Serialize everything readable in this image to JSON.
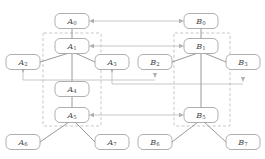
{
  "diagram": {
    "colors": {
      "node_stroke": "#9a9a9a",
      "node_fill": "#ffffff",
      "label": "#4a4a4a",
      "tree_edge": "#8f8f8f",
      "group_box": "#b9b9b9",
      "map_arrow": "#b0b0b0",
      "background": "#ffffff"
    },
    "trees": [
      {
        "name": "tree-a",
        "prefix": "A",
        "nodes": [
          {
            "id": "A0",
            "base": "A",
            "sub": "0",
            "x": 72,
            "y": 21
          },
          {
            "id": "A1",
            "base": "A",
            "sub": "1",
            "x": 72,
            "y": 46
          },
          {
            "id": "A2",
            "base": "A",
            "sub": "2",
            "x": 23,
            "y": 62
          },
          {
            "id": "A3",
            "base": "A",
            "sub": "3",
            "x": 112,
            "y": 62
          },
          {
            "id": "A4",
            "base": "A",
            "sub": "4",
            "x": 72,
            "y": 89
          },
          {
            "id": "A5",
            "base": "A",
            "sub": "5",
            "x": 72,
            "y": 115
          },
          {
            "id": "A6",
            "base": "A",
            "sub": "6",
            "x": 23,
            "y": 142
          },
          {
            "id": "A7",
            "base": "A",
            "sub": "7",
            "x": 112,
            "y": 142
          }
        ],
        "edges": [
          {
            "from": "A0",
            "to": "A1"
          },
          {
            "from": "A1",
            "to": "A2"
          },
          {
            "from": "A1",
            "to": "A3"
          },
          {
            "from": "A1",
            "to": "A4"
          },
          {
            "from": "A4",
            "to": "A5"
          },
          {
            "from": "A5",
            "to": "A6"
          },
          {
            "from": "A5",
            "to": "A7"
          }
        ],
        "group_box": {
          "x": 43,
          "y": 33,
          "width": 58,
          "height": 93
        }
      },
      {
        "name": "tree-b",
        "prefix": "B",
        "nodes": [
          {
            "id": "B0",
            "base": "B",
            "sub": "0",
            "x": 201,
            "y": 21
          },
          {
            "id": "B1",
            "base": "B",
            "sub": "1",
            "x": 201,
            "y": 46
          },
          {
            "id": "B2",
            "base": "B",
            "sub": "2",
            "x": 155,
            "y": 62
          },
          {
            "id": "B3",
            "base": "B",
            "sub": "3",
            "x": 243,
            "y": 62
          },
          {
            "id": "B5",
            "base": "B",
            "sub": "5",
            "x": 201,
            "y": 115
          },
          {
            "id": "B6",
            "base": "B",
            "sub": "6",
            "x": 155,
            "y": 142
          },
          {
            "id": "B7",
            "base": "B",
            "sub": "7",
            "x": 243,
            "y": 142
          }
        ],
        "edges": [
          {
            "from": "B0",
            "to": "B1"
          },
          {
            "from": "B1",
            "to": "B2"
          },
          {
            "from": "B1",
            "to": "B3"
          },
          {
            "from": "B1",
            "to": "B5"
          },
          {
            "from": "B5",
            "to": "B6"
          },
          {
            "from": "B5",
            "to": "B7"
          }
        ],
        "group_box": {
          "x": 174,
          "y": 33,
          "width": 56,
          "height": 93
        }
      }
    ],
    "mappings": [
      {
        "name": "map-a0-b0",
        "from": "A0",
        "to": "B0",
        "y": 21,
        "x1": 88,
        "x2": 185,
        "bidirectional": true
      },
      {
        "name": "map-a1-b1",
        "from": "A1",
        "to": "B1",
        "y": 46,
        "x1": 88,
        "x2": 185,
        "bidirectional": true
      },
      {
        "name": "map-a5-b5",
        "from": "A5",
        "to": "B5",
        "y": 115,
        "x1": 88,
        "x2": 185,
        "bidirectional": true
      }
    ],
    "drop_arrows": [
      {
        "name": "drop-a2",
        "from": "A2",
        "x": 23,
        "y1": 70,
        "y2": 80
      },
      {
        "name": "drop-a3",
        "from": "A3",
        "x": 112,
        "y1": 70,
        "y2": 84
      },
      {
        "name": "drop-b2",
        "from": "B2",
        "x": 155,
        "y1": 70,
        "y2": 80
      },
      {
        "name": "drop-b3",
        "from": "B3",
        "x": 243,
        "y1": 70,
        "y2": 84
      }
    ],
    "routes": [
      {
        "name": "route-left-lower",
        "points": "23,80 112,80"
      },
      {
        "name": "route-right-lower",
        "points": "112,84 243,84"
      },
      {
        "name": "route-mid-left",
        "points": "23,80 155,80"
      }
    ],
    "node_size": {
      "width": 34,
      "height": 15,
      "radius": 5
    }
  }
}
